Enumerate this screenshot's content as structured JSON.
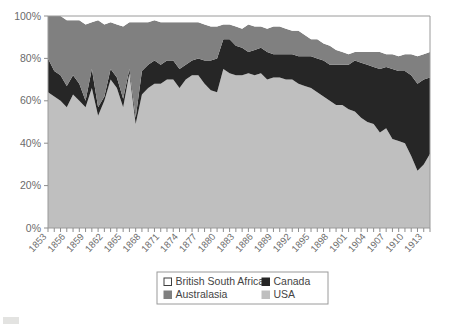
{
  "chart_data": {
    "type": "area",
    "stacked": true,
    "normalized_percent": true,
    "title": "",
    "subtitle": "",
    "xlabel": "",
    "ylabel": "",
    "ylim": [
      0,
      100
    ],
    "ytick_labels": [
      "0%",
      "20%",
      "40%",
      "60%",
      "80%",
      "100%"
    ],
    "ytick_values": [
      0,
      20,
      40,
      60,
      80,
      100
    ],
    "grid": false,
    "legend_position": "bottom-center",
    "xlim": [
      1853,
      1914
    ],
    "x": [
      1853,
      1854,
      1855,
      1856,
      1857,
      1858,
      1859,
      1860,
      1861,
      1862,
      1863,
      1864,
      1865,
      1866,
      1867,
      1868,
      1869,
      1870,
      1871,
      1872,
      1873,
      1874,
      1875,
      1876,
      1877,
      1878,
      1879,
      1880,
      1881,
      1882,
      1883,
      1884,
      1885,
      1886,
      1887,
      1888,
      1889,
      1890,
      1891,
      1892,
      1893,
      1894,
      1895,
      1896,
      1897,
      1898,
      1899,
      1900,
      1901,
      1902,
      1903,
      1904,
      1905,
      1906,
      1907,
      1908,
      1909,
      1910,
      1911,
      1912,
      1913,
      1914
    ],
    "xtick_labels": [
      "1853",
      "1856",
      "1859",
      "1862",
      "1865",
      "1868",
      "1871",
      "1874",
      "1877",
      "1880",
      "1883",
      "1886",
      "1889",
      "1892",
      "1895",
      "1898",
      "1901",
      "1904",
      "1907",
      "1910",
      "1913"
    ],
    "xtick_label_step_years": 3,
    "series": [
      {
        "name": "USA",
        "color": "#bfbfbf",
        "stack_order": 1,
        "values": [
          64,
          62,
          60,
          57,
          63,
          60,
          57,
          66,
          53,
          60,
          70,
          66,
          57,
          73,
          49,
          63,
          66,
          68,
          68,
          70,
          70,
          66,
          70,
          72,
          72,
          68,
          65,
          64,
          75,
          73,
          72,
          72,
          73,
          72,
          73,
          70,
          71,
          71,
          70,
          70,
          68,
          67,
          66,
          64,
          62,
          60,
          58,
          58,
          56,
          55,
          52,
          50,
          49,
          45,
          47,
          42,
          41,
          40,
          34,
          27,
          30,
          35
        ]
      },
      {
        "name": "Canada",
        "color": "#262626",
        "stack_order": 2,
        "values": [
          16,
          12,
          12,
          10,
          9,
          8,
          3,
          9,
          4,
          2,
          5,
          5,
          4,
          2,
          3,
          11,
          11,
          11,
          9,
          9,
          9,
          9,
          7,
          7,
          8,
          11,
          14,
          16,
          14,
          16,
          14,
          13,
          10,
          12,
          12,
          13,
          11,
          11,
          12,
          12,
          13,
          14,
          15,
          16,
          17,
          17,
          19,
          19,
          21,
          24,
          26,
          27,
          27,
          30,
          29,
          33,
          33,
          34,
          38,
          41,
          40,
          36
        ]
      },
      {
        "name": "Australasia",
        "color": "#808080",
        "stack_order": 3,
        "values": [
          20,
          26,
          28,
          31,
          26,
          30,
          36,
          22,
          41,
          34,
          22,
          25,
          34,
          22,
          45,
          23,
          20,
          19,
          20,
          18,
          18,
          22,
          20,
          18,
          17,
          17,
          16,
          15,
          7,
          7,
          9,
          9,
          13,
          11,
          10,
          11,
          13,
          13,
          12,
          11,
          12,
          10,
          8,
          9,
          8,
          9,
          7,
          6,
          5,
          4,
          5,
          6,
          7,
          8,
          6,
          7,
          7,
          8,
          10,
          13,
          12,
          12
        ]
      },
      {
        "name": "British South Africa",
        "color": "#ffffff",
        "stack_order": 4,
        "values": [
          0,
          0,
          0,
          2,
          2,
          2,
          4,
          3,
          2,
          4,
          3,
          4,
          5,
          3,
          3,
          3,
          3,
          2,
          3,
          3,
          3,
          3,
          3,
          3,
          3,
          4,
          5,
          5,
          4,
          4,
          5,
          6,
          4,
          5,
          5,
          6,
          5,
          5,
          6,
          7,
          7,
          9,
          11,
          11,
          13,
          14,
          16,
          17,
          18,
          17,
          17,
          17,
          17,
          17,
          18,
          18,
          19,
          18,
          18,
          19,
          18,
          17
        ]
      }
    ]
  },
  "legend": {
    "entries": [
      {
        "label": "British South Africa",
        "swatch": "#ffffff",
        "border": "#3f3f3f"
      },
      {
        "label": "Canada",
        "swatch": "#262626",
        "border": "#262626"
      },
      {
        "label": "Australasia",
        "swatch": "#808080",
        "border": "#808080"
      },
      {
        "label": "USA",
        "swatch": "#bfbfbf",
        "border": "#bfbfbf"
      }
    ],
    "box_border_color": "#9a9a9a"
  },
  "axes": {
    "frame_color": "#9a9a9a",
    "tick_color": "#8d8d8d"
  }
}
